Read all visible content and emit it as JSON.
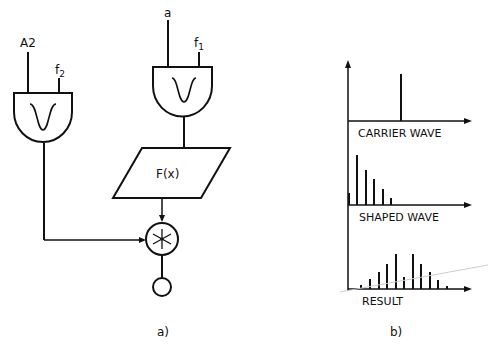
{
  "panel_a": {
    "caption": "a)",
    "oscillator_left": {
      "amp_input": "A2",
      "freq_input": "f",
      "freq_sub": "2",
      "waveform_icon": "bell-curve-icon"
    },
    "oscillator_right": {
      "amp_input": "a",
      "freq_input": "f",
      "freq_sub": "1",
      "waveform_icon": "bell-curve-icon"
    },
    "function_box": "F(x)",
    "multiplier_icon": "asterisk-multiply-icon",
    "output_icon": "output-circle-icon"
  },
  "panel_b": {
    "caption": "b)",
    "spectra": [
      {
        "label": "CARRIER WAVE"
      },
      {
        "label": "SHAPED WAVE"
      },
      {
        "label": "RESULT"
      }
    ]
  },
  "colors": {
    "ink": "#111111",
    "background": "#ffffff"
  }
}
